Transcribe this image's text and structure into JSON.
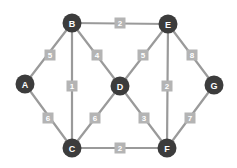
{
  "chart_data": {
    "type": "diagram",
    "diagram_kind": "weighted-undirected-graph",
    "title": "",
    "colors": {
      "background": "#ffffff",
      "node_fill": "#3c3c3c",
      "node_text": "#ffffff",
      "edge": "#9a9a9a",
      "weight_box": "#b4b4b4",
      "weight_text": "#ffffff"
    },
    "node_radius": 9.5,
    "weight_box_size": 11,
    "nodes": [
      {
        "id": "A",
        "label": "A",
        "x": 25,
        "y": 84
      },
      {
        "id": "B",
        "label": "B",
        "x": 72,
        "y": 23
      },
      {
        "id": "C",
        "label": "C",
        "x": 72,
        "y": 148
      },
      {
        "id": "D",
        "label": "D",
        "x": 120,
        "y": 86
      },
      {
        "id": "E",
        "label": "E",
        "x": 168,
        "y": 24
      },
      {
        "id": "F",
        "label": "F",
        "x": 167,
        "y": 148
      },
      {
        "id": "G",
        "label": "G",
        "x": 214,
        "y": 85
      }
    ],
    "edges": [
      {
        "id": "A-B",
        "source": "A",
        "target": "B",
        "weight": "5",
        "label_x": 50,
        "label_y": 55
      },
      {
        "id": "A-C",
        "source": "A",
        "target": "C",
        "weight": "6",
        "label_x": 48,
        "label_y": 118
      },
      {
        "id": "B-E",
        "source": "B",
        "target": "E",
        "weight": "2",
        "label_x": 120,
        "label_y": 23
      },
      {
        "id": "B-C",
        "source": "B",
        "target": "C",
        "weight": "1",
        "label_x": 72,
        "label_y": 86
      },
      {
        "id": "B-D",
        "source": "B",
        "target": "D",
        "weight": "4",
        "label_x": 97,
        "label_y": 55
      },
      {
        "id": "D-E",
        "source": "D",
        "target": "E",
        "weight": "5",
        "label_x": 143,
        "label_y": 55
      },
      {
        "id": "E-G",
        "source": "E",
        "target": "G",
        "weight": "8",
        "label_x": 192,
        "label_y": 55
      },
      {
        "id": "E-F",
        "source": "E",
        "target": "F",
        "weight": "2",
        "label_x": 167,
        "label_y": 86
      },
      {
        "id": "C-D",
        "source": "C",
        "target": "D",
        "weight": "6",
        "label_x": 95,
        "label_y": 118
      },
      {
        "id": "D-F",
        "source": "D",
        "target": "F",
        "weight": "3",
        "label_x": 144,
        "label_y": 118
      },
      {
        "id": "F-G",
        "source": "F",
        "target": "G",
        "weight": "7",
        "label_x": 190,
        "label_y": 118
      },
      {
        "id": "C-F",
        "source": "C",
        "target": "F",
        "weight": "2",
        "label_x": 120,
        "label_y": 148
      }
    ]
  }
}
